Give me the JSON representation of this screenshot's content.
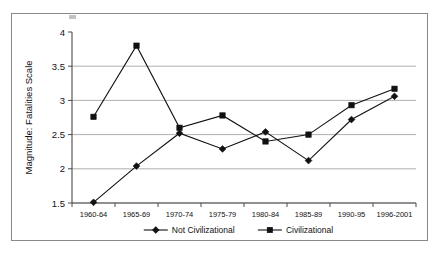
{
  "chart_data": {
    "type": "line",
    "title": "",
    "xlabel": "",
    "ylabel": "Magnitude: Fatalities Scale",
    "categories": [
      "1960-64",
      "1965-69",
      "1970-74",
      "1975-79",
      "1980-84",
      "1985-89",
      "1990-95",
      "1996-2001"
    ],
    "ylim": [
      1.5,
      4
    ],
    "yticks": [
      "1.5",
      "2",
      "2.5",
      "3",
      "3.5",
      "4"
    ],
    "ytick_values": [
      1.5,
      2,
      2.5,
      3,
      3.5,
      4
    ],
    "grid": true,
    "legend_position": "bottom",
    "series": [
      {
        "name": "Not Civilizational",
        "marker": "diamond",
        "color": "#111111",
        "values": [
          1.51,
          2.04,
          2.52,
          2.29,
          2.54,
          2.12,
          2.72,
          3.06
        ]
      },
      {
        "name": "Civilizational",
        "marker": "square",
        "color": "#111111",
        "values": [
          2.76,
          3.8,
          2.6,
          2.78,
          2.4,
          2.5,
          2.93,
          3.17
        ]
      }
    ]
  },
  "legend": {
    "items": [
      {
        "label": "Not Civilizational",
        "marker": "diamond"
      },
      {
        "label": "Civilizational",
        "marker": "square"
      }
    ]
  }
}
